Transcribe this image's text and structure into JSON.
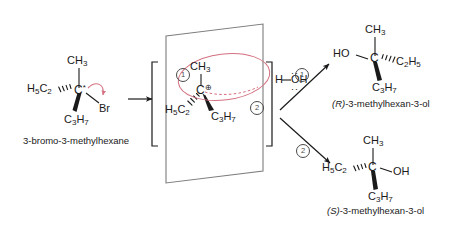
{
  "diagram": {
    "background_color": "#ffffff",
    "ink_color": "#1a1a1a",
    "accent_color": "#d4707f",
    "marker_color": "#4a4a4a"
  },
  "reactant": {
    "name": "3-bromo-3-methylhexane",
    "center_atom": "C",
    "stereo_marker": "*",
    "substituent_top": {
      "text": "CH",
      "sub": "3"
    },
    "substituent_left": {
      "text": "H",
      "sub1": "5",
      "text2": "C",
      "sub2": "2"
    },
    "substituent_down": {
      "text": "C",
      "sub1": "3",
      "text2": "H",
      "sub2": "7"
    },
    "leaving_group": "Br",
    "curly_arrow_label": "heterolysis of C-Br bond"
  },
  "reaction_arrow": {
    "label": ""
  },
  "intermediate": {
    "center_atom": "C",
    "charge": "⊕",
    "substituent_top": {
      "text": "CH",
      "sub": "3"
    },
    "substituent_lower_left": {
      "text": "H",
      "sub1": "5",
      "text2": "C",
      "sub2": "2"
    },
    "substituent_lower_right": {
      "text": "C",
      "sub1": "3",
      "text2": "H",
      "sub2": "7"
    },
    "plane_label": "trigonal planar carbocation",
    "bracket_left": "[",
    "bracket_right": "]",
    "nucleophile": {
      "formula_h": "H",
      "formula_oh": "OH",
      "o_label": "O",
      "name": "water"
    },
    "attack_top_marker": "1",
    "attack_bottom_marker": "2"
  },
  "products": [
    {
      "marker": "1",
      "name_prefix": "(R)",
      "name_rest": "-3-methylhexan-3-ol",
      "center_atom": "C",
      "substituent_top": {
        "text": "CH",
        "sub": "3"
      },
      "substituent_left": "HO",
      "substituent_right": {
        "text": "C",
        "sub1": "2",
        "text2": "H",
        "sub2": "5"
      },
      "substituent_down": {
        "text": "C",
        "sub1": "3",
        "text2": "H",
        "sub2": "7"
      },
      "left_bond_style": "plain",
      "right_bond_style": "hashed",
      "down_bond_style": "wedge"
    },
    {
      "marker": "2",
      "name_prefix": "(S)",
      "name_rest": "-3-methylhexan-3-ol",
      "center_atom": "C",
      "substituent_top": {
        "text": "CH",
        "sub": "3"
      },
      "substituent_left": {
        "text": "H",
        "sub1": "5",
        "text2": "C",
        "sub2": "2"
      },
      "substituent_right": "OH",
      "substituent_down": {
        "text": "C",
        "sub1": "3",
        "text2": "H",
        "sub2": "7"
      },
      "left_bond_style": "hashed",
      "right_bond_style": "plain",
      "down_bond_style": "wedge"
    }
  ]
}
